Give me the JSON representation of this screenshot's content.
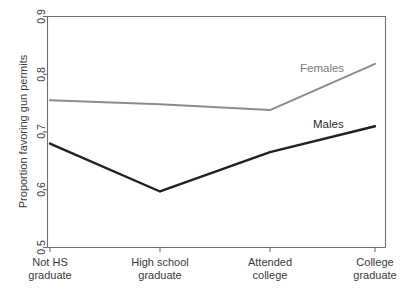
{
  "chart_data": {
    "type": "line",
    "title": "",
    "subtitle": "",
    "xlabel": "",
    "ylabel": "Proportion favoring gun permits",
    "categories": [
      "Not HS graduate",
      "High school graduate",
      "Attended college",
      "College graduate"
    ],
    "category_lines": [
      [
        "Not HS",
        "graduate"
      ],
      [
        "High school",
        "graduate"
      ],
      [
        "Attended",
        "college"
      ],
      [
        "College",
        "graduate"
      ]
    ],
    "series": [
      {
        "name": "Females",
        "color": "#8c8c8c",
        "values": [
          0.755,
          0.748,
          0.738,
          0.818
        ]
      },
      {
        "name": "Males",
        "color": "#231f20",
        "values": [
          0.68,
          0.597,
          0.665,
          0.71
        ]
      }
    ],
    "ylim": [
      0.5,
      0.9
    ],
    "yticks": [
      0.5,
      0.6,
      0.7,
      0.8,
      0.9
    ],
    "ytick_labels": [
      "0.5",
      "0.6",
      "0.7",
      "0.8",
      "0.9"
    ],
    "grid": false,
    "legend": "inline-annotations",
    "annotations": [
      {
        "text": "Females",
        "series": "Females"
      },
      {
        "text": "Males",
        "series": "Males"
      }
    ]
  },
  "figure": {
    "background": "#ffffff",
    "frame_color": "#6f6f6f",
    "text_color": "#3b3b3b"
  }
}
